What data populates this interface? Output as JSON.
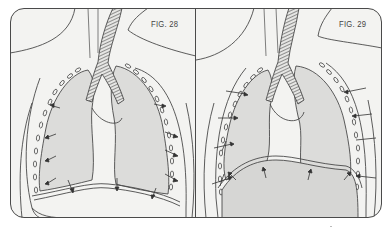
{
  "figures": [
    {
      "label": "FIG. 28",
      "state": "inspiration - diaphragm lowered, arrows show lungs expanding outward and downward",
      "colors": {
        "background": "#f2f2f0",
        "lung": "#dcdcda",
        "line": "#4a4a4a",
        "trachea_stripe": "#555555"
      }
    },
    {
      "label": "FIG. 29",
      "state": "expiration - diaphragm raised (shaded dome), arrows show lungs compressing inward and upward",
      "colors": {
        "background": "#f2f2f0",
        "lung": "#dcdcda",
        "diaphragm": "#d6d6d4",
        "line": "#4a4a4a"
      }
    }
  ],
  "colors": {
    "page": "#ffffff",
    "frame": "#4a4a4a"
  }
}
